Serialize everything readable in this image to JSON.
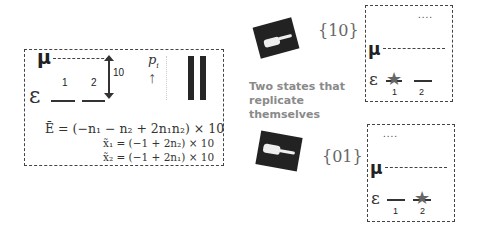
{
  "left_panel": {
    "mu_label": "μ",
    "epsilon_label": "ε",
    "site_labels": [
      "1",
      "2"
    ],
    "gap_label": "10",
    "prob_label": "p",
    "prob_sub": "i",
    "arrow": "↑",
    "bars": [
      {
        "site": "2",
        "value": 1.0
      },
      {
        "site": "3",
        "value": 1.0
      }
    ],
    "equations": [
      "Ē = (−n₁ − n₂ + 2n₁n₂) × 10",
      "x̃₁ = (−1 + 2n₂) × 10",
      "x̃₂ = (−1 + 2n₁) × 10"
    ]
  },
  "middle": {
    "caption_lines": [
      "Two states that",
      "replicate",
      "themselves"
    ],
    "states": [
      "{10}",
      "{01}"
    ]
  },
  "right_panels": [
    {
      "dots": "....",
      "mu_label": "μ",
      "epsilon_label": "ε",
      "site_labels": [
        "1",
        "2"
      ],
      "occupied_site": "1",
      "star": "★"
    },
    {
      "dots": "....",
      "mu_label": "μ",
      "epsilon_label": "ε",
      "site_labels": [
        "1",
        "2"
      ],
      "occupied_site": "2",
      "star": "★"
    }
  ]
}
